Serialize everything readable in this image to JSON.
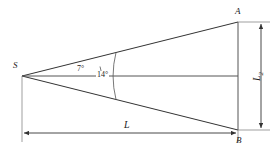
{
  "figure": {
    "type": "geometry-diagram",
    "background_color": "#ffffff",
    "line_color": "#333333",
    "text_color": "#1a1a1a",
    "points": {
      "apex": {
        "label": "S",
        "x": 22,
        "y": 76
      },
      "top": {
        "label": "A",
        "x": 238,
        "y": 22
      },
      "bottom": {
        "label": "B",
        "x": 238,
        "y": 130
      }
    },
    "angles": {
      "half": {
        "label": "7°",
        "value": 7,
        "unit": "degrees"
      },
      "full": {
        "label": "14°",
        "value": 14,
        "unit": "degrees"
      }
    },
    "dimensions": {
      "horizontal": {
        "label": "L",
        "orientation": "horizontal",
        "position": "bottom"
      },
      "vertical": {
        "label": "L",
        "subscript": "2",
        "orientation": "vertical",
        "position": "right"
      }
    }
  }
}
